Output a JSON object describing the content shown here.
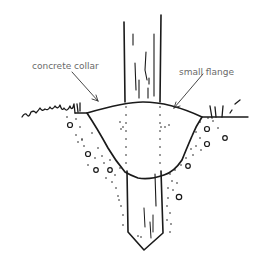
{
  "diagram": {
    "type": "illustration",
    "labels": [
      {
        "id": "concrete-collar",
        "text": "concrete collar"
      },
      {
        "id": "small-flange",
        "text": "small flange"
      }
    ],
    "colors": {
      "line": "#1a1a1a",
      "label_text": "#6a6a6a",
      "background": "#ffffff"
    }
  }
}
